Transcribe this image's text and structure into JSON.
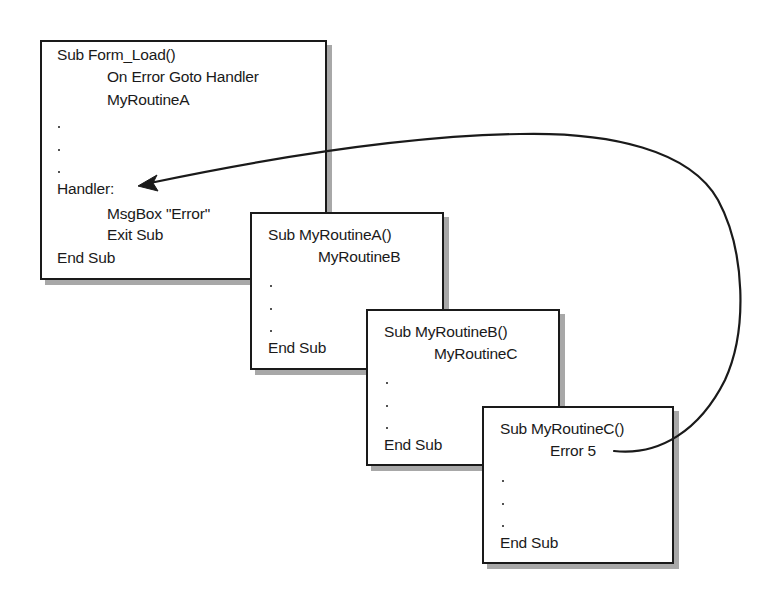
{
  "diagram": {
    "routines": [
      {
        "id": "form-load",
        "lines": [
          {
            "text": "Sub Form_Load()",
            "indent": false
          },
          {
            "text": "On Error Goto Handler",
            "indent": true
          },
          {
            "text": "MyRoutineA",
            "indent": true
          },
          {
            "text": ".",
            "indent": false
          },
          {
            "text": ".",
            "indent": false
          },
          {
            "text": ".",
            "indent": false
          },
          {
            "text": "Handler:",
            "indent": false
          },
          {
            "text": "MsgBox \"Error\"",
            "indent": true
          },
          {
            "text": "Exit Sub",
            "indent": true
          },
          {
            "text": "End Sub",
            "indent": false
          }
        ]
      },
      {
        "id": "my-routine-a",
        "lines": [
          {
            "text": "Sub MyRoutineA()",
            "indent": false
          },
          {
            "text": "MyRoutineB",
            "indent": true
          },
          {
            "text": ".",
            "indent": false
          },
          {
            "text": ".",
            "indent": false
          },
          {
            "text": ".",
            "indent": false
          },
          {
            "text": "End Sub",
            "indent": false
          }
        ]
      },
      {
        "id": "my-routine-b",
        "lines": [
          {
            "text": "Sub MyRoutineB()",
            "indent": false
          },
          {
            "text": "MyRoutineC",
            "indent": true
          },
          {
            "text": ".",
            "indent": false
          },
          {
            "text": ".",
            "indent": false
          },
          {
            "text": ".",
            "indent": false
          },
          {
            "text": "End Sub",
            "indent": false
          }
        ]
      },
      {
        "id": "my-routine-c",
        "lines": [
          {
            "text": "Sub MyRoutineC()",
            "indent": false
          },
          {
            "text": "Error 5",
            "indent": true
          },
          {
            "text": ".",
            "indent": false
          },
          {
            "text": ".",
            "indent": false
          },
          {
            "text": ".",
            "indent": false
          },
          {
            "text": "End Sub",
            "indent": false
          }
        ]
      }
    ],
    "arrow": {
      "from": "Error 5 (MyRoutineC)",
      "to": "Handler: (Form_Load)",
      "meaning": "error propagates up the call stack to the handler"
    },
    "colors": {
      "ink": "#1a1a1a",
      "shadow": "#a8a8a8",
      "background": "#ffffff"
    }
  }
}
